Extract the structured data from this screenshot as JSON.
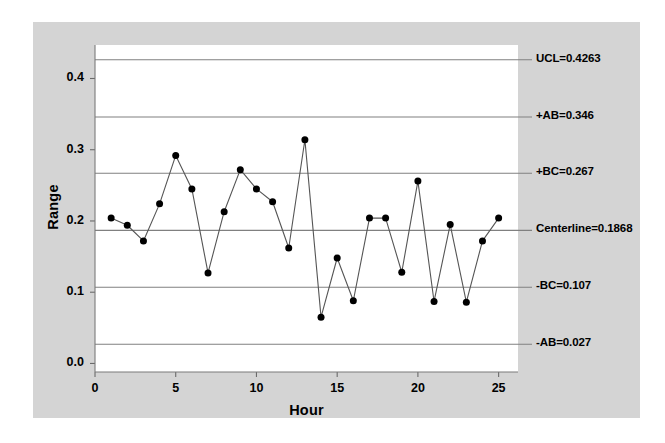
{
  "chart_data": {
    "type": "line",
    "title": "",
    "xlabel": "Hour",
    "ylabel": "Range",
    "xlim": [
      0,
      26.2
    ],
    "ylim": [
      -0.012,
      0.447
    ],
    "xticks": [
      "0",
      "5",
      "10",
      "15",
      "20",
      "25"
    ],
    "xtick_values": [
      0,
      5,
      10,
      15,
      20,
      25
    ],
    "yticks": [
      "0.0",
      "0.1",
      "0.2",
      "0.3",
      "0.4"
    ],
    "ytick_values": [
      0.0,
      0.1,
      0.2,
      0.3,
      0.4
    ],
    "grid": false,
    "legend": "none",
    "marker": "filled-circle",
    "line_color": "#555555",
    "marker_color": "#000000",
    "panel_color": "#d4d4d4",
    "plot_bg_color": "#ffffff",
    "limit_line_color": "#808080",
    "x": [
      1,
      2,
      3,
      4,
      5,
      6,
      7,
      8,
      9,
      10,
      11,
      12,
      13,
      14,
      15,
      16,
      17,
      18,
      19,
      20,
      21,
      22,
      23,
      24,
      25
    ],
    "values": [
      0.204,
      0.194,
      0.172,
      0.224,
      0.292,
      0.245,
      0.127,
      0.213,
      0.272,
      0.245,
      0.227,
      0.162,
      0.314,
      0.065,
      0.148,
      0.088,
      0.204,
      0.204,
      0.128,
      0.256,
      0.087,
      0.195,
      0.086,
      0.172,
      0.204
    ],
    "control_limits": [
      {
        "key": "ucl",
        "label": "UCL=0.4263",
        "value": 0.4263
      },
      {
        "key": "plus_ab",
        "label": "+AB=0.346",
        "value": 0.346
      },
      {
        "key": "plus_bc",
        "label": "+BC=0.267",
        "value": 0.267
      },
      {
        "key": "centerline",
        "label": "Centerline=0.1868",
        "value": 0.1868
      },
      {
        "key": "minus_bc",
        "label": "-BC=0.107",
        "value": 0.107
      },
      {
        "key": "minus_ab",
        "label": "-AB=0.027",
        "value": 0.027
      }
    ]
  }
}
